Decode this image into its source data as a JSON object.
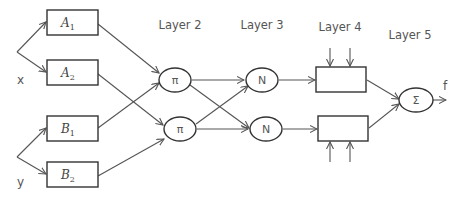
{
  "diagram": {
    "type": "ANFIS architecture",
    "inputs": {
      "x": "x",
      "y": "y"
    },
    "layer_labels": {
      "layer2": "Layer 2",
      "layer3": "Layer 3",
      "layer4": "Layer 4",
      "layer5": "Layer 5"
    },
    "layer1_nodes": {
      "a1": {
        "letter": "A",
        "sub": "1"
      },
      "a2": {
        "letter": "A",
        "sub": "2"
      },
      "b1": {
        "letter": "B",
        "sub": "1"
      },
      "b2": {
        "letter": "B",
        "sub": "2"
      }
    },
    "layer2_nodes": {
      "p1": "π",
      "p2": "π"
    },
    "layer3_nodes": {
      "n1": "N",
      "n2": "N"
    },
    "layer5_node": "Σ",
    "output": "f",
    "colors": {
      "stroke": "#333333",
      "arrow": "#555555",
      "text": "#555555"
    }
  }
}
